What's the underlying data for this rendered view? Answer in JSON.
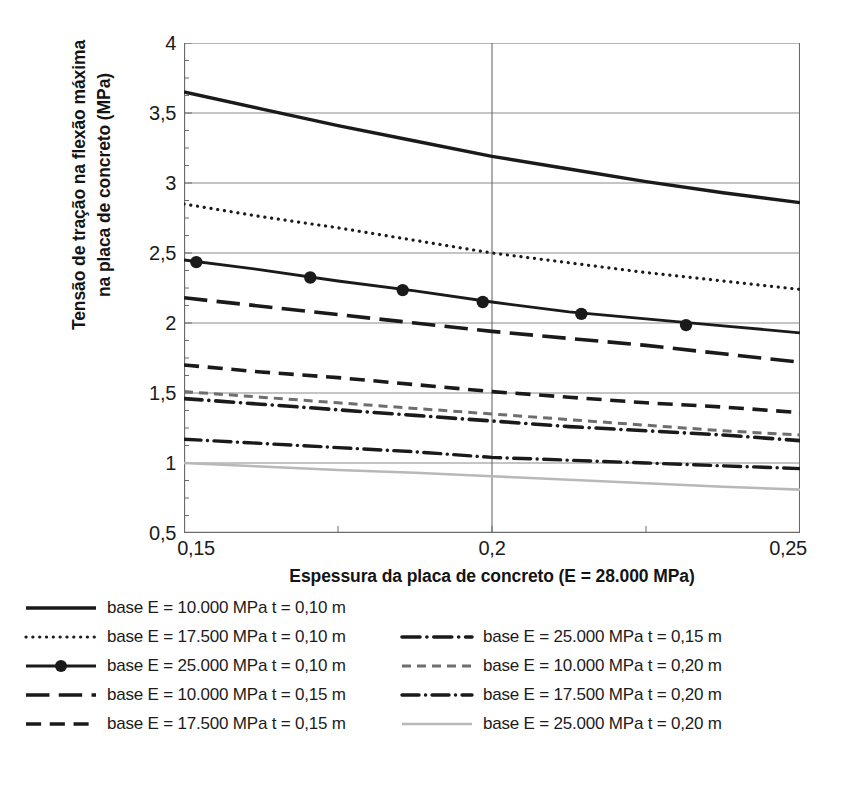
{
  "chart_data": {
    "type": "line",
    "title": "",
    "xlabel": "Espessura da placa de concreto (E = 28.000 MPa)",
    "ylabel": "Tensão de tração na flexão máxima na placa de concreto (MPa)",
    "ylabel_line1": "Tensão de tração na flexão máxima",
    "ylabel_line2": "na placa de concreto (MPa)",
    "xlim": [
      0.15,
      0.25
    ],
    "ylim": [
      0.5,
      4.0
    ],
    "xticks": [
      0.15,
      0.2,
      0.25
    ],
    "xtick_labels": [
      "0,15",
      "0,2",
      "0,25"
    ],
    "yticks": [
      0.5,
      1,
      1.5,
      2,
      2.5,
      3,
      3.5,
      4
    ],
    "ytick_labels": [
      "0,5",
      "1",
      "1,5",
      "2",
      "2,5",
      "3",
      "3,5",
      "4"
    ],
    "grid": "horizontal-and-vertical-at-0,2",
    "legend_position": "below-plot-two-columns",
    "x": [
      0.15,
      0.1625,
      0.175,
      0.1875,
      0.2,
      0.2125,
      0.225,
      0.2375,
      0.25
    ],
    "series": [
      {
        "name": "base E = 10.000  MPa t = 0,10 m",
        "style": "solid",
        "color": "#1a1a1a",
        "width": 3.4,
        "markers": false,
        "values": [
          3.65,
          3.53,
          3.41,
          3.3,
          3.19,
          3.1,
          3.01,
          2.93,
          2.86
        ]
      },
      {
        "name": "base E = 17.500  MPa t = 0,10 m",
        "style": "dotted",
        "color": "#1a1a1a",
        "width": 3.2,
        "markers": false,
        "values": [
          2.85,
          2.76,
          2.68,
          2.59,
          2.5,
          2.43,
          2.36,
          2.3,
          2.24
        ]
      },
      {
        "name": "base E = 25.000  MPa t = 0,10 m",
        "style": "solid-markers",
        "color": "#1a1a1a",
        "width": 2.8,
        "markers": true,
        "marker_x": [
          0.152,
          0.1705,
          0.1855,
          0.1985,
          0.2145,
          0.2315
        ],
        "marker_y": [
          2.435,
          2.325,
          2.235,
          2.15,
          2.065,
          1.985
        ],
        "values": [
          2.45,
          2.38,
          2.3,
          2.23,
          2.15,
          2.08,
          2.03,
          1.98,
          1.93
        ]
      },
      {
        "name": "base E = 10.000  MPa t = 0,15 m",
        "style": "long-dash",
        "color": "#1a1a1a",
        "width": 3.6,
        "markers": false,
        "values": [
          2.18,
          2.12,
          2.06,
          2.0,
          1.94,
          1.89,
          1.84,
          1.78,
          1.72
        ]
      },
      {
        "name": "base E = 17.500  MPa t = 0,15 m",
        "style": "dash",
        "color": "#1a1a1a",
        "width": 3.6,
        "markers": false,
        "values": [
          1.7,
          1.65,
          1.61,
          1.56,
          1.51,
          1.47,
          1.43,
          1.4,
          1.36
        ]
      },
      {
        "name": "base E = 25.000  MPa t = 0,15 m",
        "style": "dash-dot",
        "color": "#1a1a1a",
        "width": 3.6,
        "markers": false,
        "values": [
          1.46,
          1.42,
          1.38,
          1.34,
          1.3,
          1.26,
          1.23,
          1.2,
          1.16
        ]
      },
      {
        "name": "base E = 10.000  MPa t = 0,20 m",
        "style": "small-dash",
        "color": "#6e6e6e",
        "width": 3.0,
        "markers": false,
        "values": [
          1.51,
          1.47,
          1.43,
          1.39,
          1.35,
          1.31,
          1.27,
          1.23,
          1.2
        ]
      },
      {
        "name": "base E = 17.500  MPa t = 0,20 m",
        "style": "dash-dot",
        "color": "#1a1a1a",
        "width": 3.4,
        "markers": false,
        "values": [
          1.17,
          1.14,
          1.11,
          1.08,
          1.04,
          1.02,
          1.0,
          0.98,
          0.96
        ]
      },
      {
        "name": "base E = 25.000  MPa t = 0,20 m",
        "style": "solid-light",
        "color": "#b8b8b8",
        "width": 2.6,
        "markers": false,
        "values": [
          1.0,
          0.975,
          0.95,
          0.93,
          0.905,
          0.88,
          0.855,
          0.83,
          0.81
        ]
      }
    ],
    "legend": [
      {
        "label": "base E = 10.000  MPa t = 0,10 m",
        "series": 0,
        "column": "left",
        "row": 0
      },
      {
        "label": "base E = 17.500  MPa t = 0,10 m",
        "series": 1,
        "column": "left",
        "row": 1
      },
      {
        "label": "base E = 25.000  MPa t = 0,10 m",
        "series": 2,
        "column": "left",
        "row": 2
      },
      {
        "label": "base E = 10.000  MPa t = 0,15 m",
        "series": 3,
        "column": "left",
        "row": 3
      },
      {
        "label": "base E = 17.500  MPa t = 0,15 m",
        "series": 4,
        "column": "left",
        "row": 4
      },
      {
        "label": "base E = 25.000  MPa t = 0,15 m",
        "series": 5,
        "column": "right",
        "row": 1
      },
      {
        "label": "base E = 10.000  MPa t = 0,20 m",
        "series": 6,
        "column": "right",
        "row": 2
      },
      {
        "label": "base E = 17.500  MPa t = 0,20 m",
        "series": 7,
        "column": "right",
        "row": 3
      },
      {
        "label": "base E = 25.000  MPa t = 0,20 m",
        "series": 8,
        "column": "right",
        "row": 4
      }
    ]
  },
  "axis_colors": {
    "grid": "#8a8a8a",
    "axis": "#6b6b6b",
    "text": "#1b1b1b"
  }
}
